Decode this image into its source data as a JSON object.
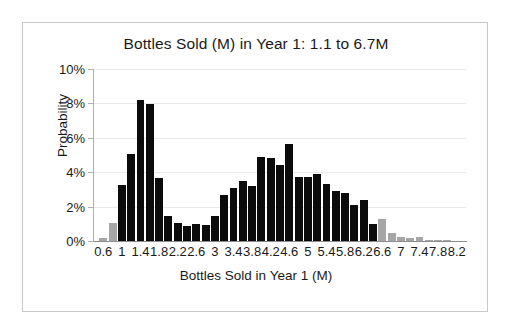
{
  "chart_data": {
    "type": "bar",
    "title": "Bottles Sold (M) in Year 1: 1.1 to 6.7M",
    "xlabel": "Bottles Sold in Year 1 (M)",
    "ylabel": "Probability",
    "grid": true,
    "legend": "none",
    "ylim": [
      0,
      10
    ],
    "ytick_labels": [
      "10%",
      "8%",
      "6%",
      "4%",
      "2%",
      "0%"
    ],
    "ytick_values": [
      10,
      8,
      6,
      4,
      2,
      0
    ],
    "xtick_labels": [
      "0.6",
      "1",
      "1.4",
      "1.8",
      "2.2",
      "2.6",
      "3",
      "3.4",
      "3.8",
      "4.2",
      "4.6",
      "5",
      "5.4",
      "5.8",
      "6.2",
      "6.6",
      "7",
      "7.4",
      "7.8",
      "8.2"
    ],
    "xtick_values": [
      0.6,
      1.0,
      1.4,
      1.8,
      2.2,
      2.6,
      3.0,
      3.4,
      3.8,
      4.2,
      4.6,
      5.0,
      5.4,
      5.8,
      6.2,
      6.6,
      7.0,
      7.4,
      7.8,
      8.2
    ],
    "bin_width": 0.2,
    "colors": {
      "in_range": "#0b0b0b",
      "out_of_range": "#a6a6a6"
    },
    "x": [
      0.6,
      0.8,
      1.0,
      1.2,
      1.4,
      1.6,
      1.8,
      2.0,
      2.2,
      2.4,
      2.6,
      2.8,
      3.0,
      3.2,
      3.4,
      3.6,
      3.8,
      4.0,
      4.2,
      4.4,
      4.6,
      4.8,
      5.0,
      5.2,
      5.4,
      5.6,
      5.8,
      6.0,
      6.2,
      6.4,
      6.6,
      6.8,
      7.0,
      7.2,
      7.4,
      7.6,
      7.8,
      8.0,
      8.2
    ],
    "values": [
      0.15,
      1.05,
      3.25,
      5.05,
      8.2,
      7.95,
      3.65,
      1.45,
      1.05,
      0.85,
      1.0,
      0.95,
      1.45,
      2.7,
      3.1,
      3.5,
      3.2,
      4.9,
      4.8,
      4.4,
      5.65,
      3.75,
      3.75,
      3.9,
      3.3,
      2.9,
      2.8,
      2.1,
      2.4,
      1.0,
      1.3,
      0.45,
      0.25,
      0.15,
      0.25,
      0.05,
      0.03,
      0.05,
      0.0
    ],
    "bar_shading": [
      "light",
      "light",
      "dark",
      "dark",
      "dark",
      "dark",
      "dark",
      "dark",
      "dark",
      "dark",
      "dark",
      "dark",
      "dark",
      "dark",
      "dark",
      "dark",
      "dark",
      "dark",
      "dark",
      "dark",
      "dark",
      "dark",
      "dark",
      "dark",
      "dark",
      "dark",
      "dark",
      "dark",
      "dark",
      "dark",
      "light",
      "light",
      "light",
      "light",
      "light",
      "light",
      "light",
      "light",
      "light"
    ],
    "annotation_range": {
      "low": 1.1,
      "high": 6.7,
      "units": "M"
    }
  }
}
